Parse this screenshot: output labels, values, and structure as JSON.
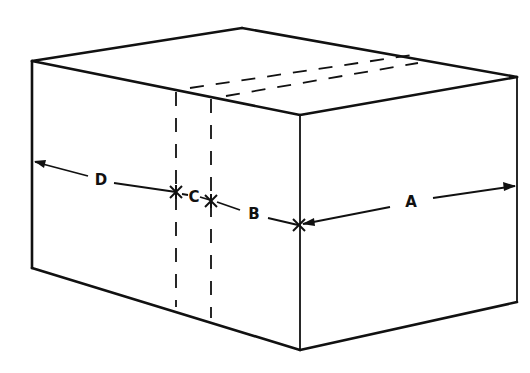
{
  "diagram": {
    "title": "",
    "type": "isometric-box-dimension-sketch",
    "labels": {
      "a": "A",
      "b": "B",
      "c": "C",
      "d": "D"
    },
    "colors": {
      "line": "#111111",
      "background": "#ffffff"
    },
    "dimensions": [
      {
        "label": "D",
        "from": "left edge",
        "to": "first dashed line"
      },
      {
        "label": "C",
        "from": "first dashed line",
        "to": "second dashed line"
      },
      {
        "label": "B",
        "from": "second dashed line",
        "to": "front corner edge"
      },
      {
        "label": "A",
        "from": "front corner edge",
        "to": "right edge"
      }
    ]
  }
}
